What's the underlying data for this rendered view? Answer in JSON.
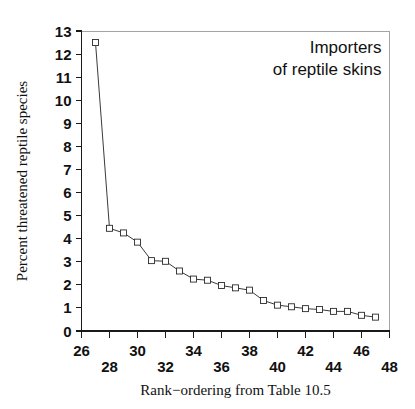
{
  "chart_data": {
    "type": "line",
    "title": "",
    "annotation_lines": [
      "Importers",
      "of reptile skins"
    ],
    "xlabel": "Rank−ordering from Table 10.5",
    "ylabel": "Percent threatened reptile species",
    "xlim": [
      26,
      48
    ],
    "ylim": [
      0,
      13
    ],
    "grid": false,
    "legend": "none",
    "marker": "open-square",
    "xticks": [
      26,
      27,
      28,
      29,
      30,
      31,
      32,
      33,
      34,
      35,
      36,
      37,
      38,
      39,
      40,
      41,
      42,
      43,
      44,
      45,
      46,
      47,
      48
    ],
    "xtick_labels": [
      "26",
      "28",
      "30",
      "32",
      "34",
      "36",
      "38",
      "40",
      "42",
      "44",
      "46",
      "48"
    ],
    "xtick_label_values": [
      26,
      28,
      30,
      32,
      34,
      36,
      38,
      40,
      42,
      44,
      46,
      48
    ],
    "yticks": [
      0,
      1,
      2,
      3,
      4,
      5,
      6,
      7,
      8,
      9,
      10,
      11,
      12,
      13
    ],
    "ytick_labels": [
      "0",
      "1",
      "2",
      "3",
      "4",
      "5",
      "6",
      "7",
      "8",
      "9",
      "10",
      "11",
      "12",
      "13"
    ],
    "x": [
      27,
      28,
      29,
      30,
      31,
      32,
      33,
      34,
      35,
      36,
      37,
      38,
      39,
      40,
      41,
      42,
      43,
      44,
      45,
      46,
      47
    ],
    "values": [
      12.5,
      4.45,
      4.25,
      3.85,
      3.05,
      3.02,
      2.6,
      2.25,
      2.2,
      1.97,
      1.87,
      1.77,
      1.32,
      1.12,
      1.05,
      0.97,
      0.93,
      0.85,
      0.85,
      0.68,
      0.6
    ],
    "series": [
      {
        "name": "Percent threatened reptile species",
        "values": [
          12.5,
          4.45,
          4.25,
          3.85,
          3.05,
          3.02,
          2.6,
          2.25,
          2.2,
          1.97,
          1.87,
          1.77,
          1.32,
          1.12,
          1.05,
          0.97,
          0.93,
          0.85,
          0.85,
          0.68,
          0.6
        ]
      }
    ],
    "colors": {
      "line": "#3a3a3a",
      "marker_fill": "#ffffff",
      "marker_stroke": "#2a2a2a",
      "axis": "#1a1a1a",
      "text": "#111111",
      "background": "#ffffff"
    }
  }
}
